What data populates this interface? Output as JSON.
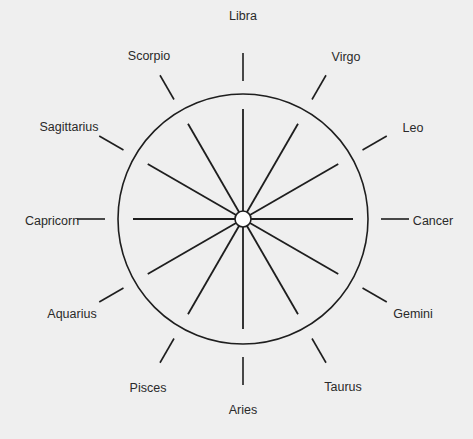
{
  "diagram": {
    "type": "zodiac-wheel",
    "center": [
      243,
      219
    ],
    "circle_radius": 125,
    "hub_radius": 8,
    "spoke_inner": 8,
    "spoke_outer": 110,
    "tick_inner": 138,
    "tick_outer": 166,
    "colors": {
      "background": "#efefef",
      "line": "#1e1e1e",
      "hub_fill": "#ffffff",
      "text": "#2a2a2a"
    },
    "signs": [
      {
        "name": "Libra",
        "angle": 90,
        "label_x": 243,
        "label_y": 16
      },
      {
        "name": "Virgo",
        "angle": 60,
        "label_x": 346,
        "label_y": 57
      },
      {
        "name": "Leo",
        "angle": 30,
        "label_x": 413,
        "label_y": 128
      },
      {
        "name": "Cancer",
        "angle": 0,
        "label_x": 433,
        "label_y": 221
      },
      {
        "name": "Gemini",
        "angle": -30,
        "label_x": 413,
        "label_y": 314
      },
      {
        "name": "Taurus",
        "angle": -60,
        "label_x": 343,
        "label_y": 387
      },
      {
        "name": "Aries",
        "angle": -90,
        "label_x": 243,
        "label_y": 410
      },
      {
        "name": "Pisces",
        "angle": -120,
        "label_x": 148,
        "label_y": 388
      },
      {
        "name": "Aquarius",
        "angle": -150,
        "label_x": 72,
        "label_y": 314
      },
      {
        "name": "Capricorn",
        "angle": 180,
        "label_x": 52,
        "label_y": 221
      },
      {
        "name": "Sagittarius",
        "angle": 150,
        "label_x": 69,
        "label_y": 127
      },
      {
        "name": "Scorpio",
        "angle": 120,
        "label_x": 149,
        "label_y": 56
      }
    ]
  }
}
